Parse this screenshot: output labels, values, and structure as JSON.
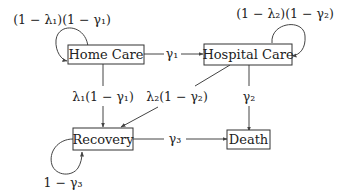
{
  "diagram": {
    "nodes": {
      "home_care": {
        "label": "Home Care"
      },
      "hospital_care": {
        "label": "Hospital Care"
      },
      "recovery": {
        "label": "Recovery"
      },
      "death": {
        "label": "Death"
      }
    },
    "edges": {
      "home_self": {
        "from": "Home Care",
        "to": "Home Care",
        "label": "(1 − λ₁)(1 − γ₁)"
      },
      "home_to_hospital": {
        "from": "Home Care",
        "to": "Hospital Care",
        "label": "γ₁"
      },
      "hospital_self": {
        "from": "Hospital Care",
        "to": "Hospital Care",
        "label": "(1 − λ₂)(1 − γ₂)"
      },
      "home_to_recovery": {
        "from": "Home Care",
        "to": "Recovery",
        "label": "λ₁(1 − γ₁)"
      },
      "hospital_to_recovery": {
        "from": "Hospital Care",
        "to": "Recovery",
        "label": "λ₂(1 − γ₂)"
      },
      "hospital_to_death": {
        "from": "Hospital Care",
        "to": "Death",
        "label": "γ₂"
      },
      "recovery_to_death": {
        "from": "Recovery",
        "to": "Death",
        "label": "γ₃"
      },
      "recovery_self": {
        "from": "Recovery",
        "to": "Recovery",
        "label": "1 − γ₃"
      }
    }
  }
}
